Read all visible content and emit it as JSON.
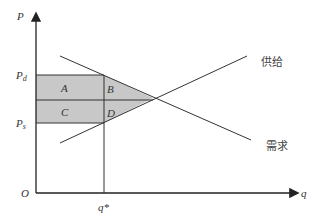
{
  "diagram": {
    "type": "supply-demand with tax wedge",
    "axes": {
      "y_label": "P",
      "x_label": "q",
      "origin_label": "O"
    },
    "price_labels": {
      "pd": "P",
      "pd_sub": "d",
      "ps": "P",
      "ps_sub": "s"
    },
    "quantity_label": "q*",
    "regions": {
      "a": "A",
      "b": "B",
      "c": "C",
      "d": "D"
    },
    "curves": {
      "supply": "供给",
      "demand": "需求"
    },
    "colors": {
      "shade": "#c8c8c8",
      "line": "#333333"
    }
  }
}
